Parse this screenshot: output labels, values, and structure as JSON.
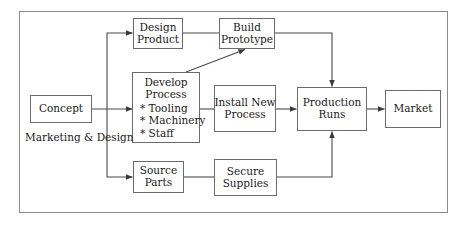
{
  "diagram": {
    "type": "flowchart",
    "frame": {
      "border_color": "#8c8c8c"
    },
    "style": {
      "box_border_color": "#6b6b6b",
      "line_color": "#4a4a4a",
      "text_color": "#1a1a1a",
      "background": "#ffffff"
    },
    "nodes": [
      {
        "id": "concept",
        "name": "concept",
        "lines": [
          "Concept"
        ],
        "x": 30,
        "y": 95,
        "w": 62,
        "h": 28,
        "font_size": 10.5
      },
      {
        "id": "design_product",
        "name": "design-product",
        "lines": [
          "Design",
          "Product"
        ],
        "x": 133,
        "y": 18,
        "w": 50,
        "h": 31,
        "font_size": 10.5
      },
      {
        "id": "build_prototype",
        "name": "build-prototype",
        "lines": [
          "Build",
          "Prototype"
        ],
        "x": 219,
        "y": 18,
        "w": 56,
        "h": 31,
        "font_size": 10.5
      },
      {
        "id": "develop_process",
        "name": "develop-process",
        "heading": [
          "Develop",
          "Process"
        ],
        "bullets": [
          "* Tooling",
          "* Machinery",
          "* Staff"
        ],
        "x": 132,
        "y": 72,
        "w": 68,
        "h": 71,
        "font_size": 10.5
      },
      {
        "id": "install_new_process",
        "name": "install-new-process",
        "lines": [
          "Install New",
          "Process"
        ],
        "x": 214,
        "y": 85,
        "w": 62,
        "h": 47,
        "font_size": 10.5
      },
      {
        "id": "production_runs",
        "name": "production-runs",
        "lines": [
          "Production",
          "Runs"
        ],
        "x": 297,
        "y": 87,
        "w": 70,
        "h": 44,
        "font_size": 10.5
      },
      {
        "id": "market",
        "name": "market",
        "lines": [
          "Market"
        ],
        "x": 385,
        "y": 90,
        "w": 56,
        "h": 38,
        "font_size": 10.5
      },
      {
        "id": "source_parts",
        "name": "source-parts",
        "lines": [
          "Source",
          "Parts"
        ],
        "x": 133,
        "y": 161,
        "w": 51,
        "h": 32,
        "font_size": 10.5
      },
      {
        "id": "secure_supplies",
        "name": "secure-supplies",
        "lines": [
          "Secure",
          "Supplies"
        ],
        "x": 214,
        "y": 159,
        "w": 63,
        "h": 37,
        "font_size": 10.5
      }
    ],
    "captions": [
      {
        "id": "marketing_design",
        "name": "marketing-and-design-caption",
        "lines": [
          "Marketing",
          "& Design"
        ],
        "x": 25,
        "y": 131,
        "w": 72,
        "font_size": 10.5
      }
    ],
    "edges": [
      {
        "id": "concept_to_trunk",
        "name": "edge-concept-to-trunk",
        "from": "concept",
        "to": "develop_process",
        "arrow": true
      },
      {
        "id": "trunk_to_design",
        "name": "edge-concept-to-design-product",
        "from": "concept",
        "to": "design_product",
        "arrow": true
      },
      {
        "id": "trunk_to_source",
        "name": "edge-concept-to-source-parts",
        "from": "concept",
        "to": "source_parts",
        "arrow": true
      },
      {
        "id": "design_to_build",
        "name": "edge-design-product-to-build-prototype",
        "from": "design_product",
        "to": "build_prototype",
        "arrow": false
      },
      {
        "id": "develop_to_build",
        "name": "edge-develop-process-to-build-prototype",
        "from": "develop_process",
        "to": "build_prototype",
        "arrow": true
      },
      {
        "id": "develop_to_install",
        "name": "edge-develop-process-to-install-new-process",
        "from": "develop_process",
        "to": "install_new_process",
        "arrow": false
      },
      {
        "id": "install_to_production",
        "name": "edge-install-new-process-to-production-runs",
        "from": "install_new_process",
        "to": "production_runs",
        "arrow": true
      },
      {
        "id": "build_to_production",
        "name": "edge-build-prototype-to-production-runs",
        "from": "build_prototype",
        "to": "production_runs",
        "arrow": true
      },
      {
        "id": "source_to_secure",
        "name": "edge-source-parts-to-secure-supplies",
        "from": "source_parts",
        "to": "secure_supplies",
        "arrow": false
      },
      {
        "id": "secure_to_production",
        "name": "edge-secure-supplies-to-production-runs",
        "from": "secure_supplies",
        "to": "production_runs",
        "arrow": true
      },
      {
        "id": "production_to_market",
        "name": "edge-production-runs-to-market",
        "from": "production_runs",
        "to": "market",
        "arrow": true
      }
    ]
  }
}
